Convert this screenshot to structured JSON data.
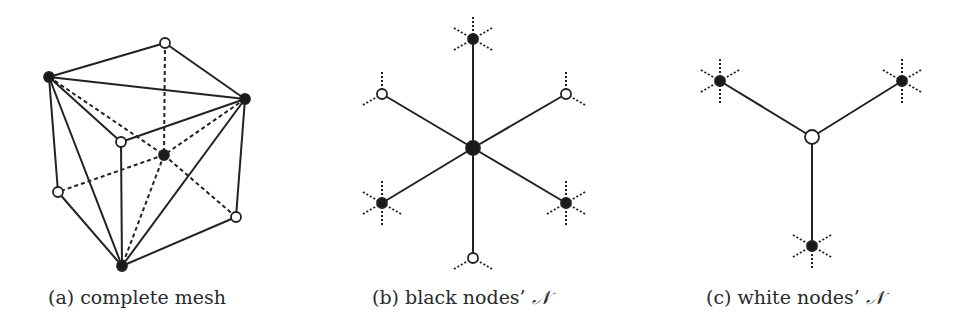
{
  "colors": {
    "ink": "#222222",
    "node_fill_black": "#1a1a1a",
    "node_fill_white": "#ffffff",
    "background": "#ffffff"
  },
  "panels": [
    {
      "id": "a",
      "caption_prefix": "(a) complete mesh",
      "caption_symbol": "",
      "caption_x": 48,
      "nodes": [
        {
          "id": "top_white",
          "x": 165,
          "y": 43,
          "color": "white",
          "r": 5
        },
        {
          "id": "left_black",
          "x": 49,
          "y": 77,
          "color": "black",
          "r": 5
        },
        {
          "id": "right_black",
          "x": 245,
          "y": 99,
          "color": "black",
          "r": 5
        },
        {
          "id": "front_white",
          "x": 121,
          "y": 142,
          "color": "white",
          "r": 5
        },
        {
          "id": "center_black",
          "x": 164,
          "y": 155,
          "color": "black",
          "r": 5
        },
        {
          "id": "left_white",
          "x": 58,
          "y": 192,
          "color": "white",
          "r": 5
        },
        {
          "id": "right_white",
          "x": 236,
          "y": 217,
          "color": "white",
          "r": 5
        },
        {
          "id": "bottom_black",
          "x": 122,
          "y": 266,
          "color": "black",
          "r": 5
        }
      ],
      "edges": [
        {
          "from": "left_black",
          "to": "top_white",
          "style": "solid"
        },
        {
          "from": "top_white",
          "to": "right_black",
          "style": "solid"
        },
        {
          "from": "left_black",
          "to": "right_black",
          "style": "solid"
        },
        {
          "from": "left_black",
          "to": "front_white",
          "style": "solid"
        },
        {
          "from": "front_white",
          "to": "right_black",
          "style": "solid"
        },
        {
          "from": "left_black",
          "to": "left_white",
          "style": "solid"
        },
        {
          "from": "left_black",
          "to": "bottom_black",
          "style": "solid"
        },
        {
          "from": "front_white",
          "to": "bottom_black",
          "style": "solid"
        },
        {
          "from": "right_black",
          "to": "bottom_black",
          "style": "solid"
        },
        {
          "from": "right_black",
          "to": "right_white",
          "style": "solid"
        },
        {
          "from": "right_white",
          "to": "bottom_black",
          "style": "solid"
        },
        {
          "from": "left_white",
          "to": "bottom_black",
          "style": "solid"
        },
        {
          "from": "top_white",
          "to": "center_black",
          "style": "dashed"
        },
        {
          "from": "left_black",
          "to": "center_black",
          "style": "dashed"
        },
        {
          "from": "center_black",
          "to": "right_white",
          "style": "dashed"
        },
        {
          "from": "right_black",
          "to": "center_black",
          "style": "dashed"
        },
        {
          "from": "center_black",
          "to": "left_white",
          "style": "dashed"
        },
        {
          "from": "center_black",
          "to": "bottom_black",
          "style": "dashed"
        }
      ]
    },
    {
      "id": "b",
      "caption_prefix": "(b) black nodes’ ",
      "caption_symbol": "𝒩",
      "caption_x": 372,
      "nodes": [
        {
          "id": "center",
          "x": 473,
          "y": 148,
          "color": "black",
          "r": 7
        },
        {
          "id": "top",
          "x": 473,
          "y": 39,
          "color": "black",
          "r": 5,
          "stubs": [
            90,
            30,
            150,
            210,
            330
          ]
        },
        {
          "id": "upper_left",
          "x": 382,
          "y": 94,
          "color": "white",
          "r": 5,
          "stubs": [
            90,
            210
          ]
        },
        {
          "id": "upper_right",
          "x": 566,
          "y": 94,
          "color": "white",
          "r": 5,
          "stubs": [
            90,
            330
          ]
        },
        {
          "id": "lower_left",
          "x": 382,
          "y": 203,
          "color": "black",
          "r": 5,
          "stubs": [
            90,
            150,
            210,
            270,
            330
          ]
        },
        {
          "id": "lower_right",
          "x": 566,
          "y": 203,
          "color": "black",
          "r": 5,
          "stubs": [
            90,
            30,
            210,
            270,
            330
          ]
        },
        {
          "id": "bottom",
          "x": 473,
          "y": 258,
          "color": "white",
          "r": 5,
          "stubs": [
            210,
            330
          ]
        }
      ],
      "edges": [
        {
          "from": "center",
          "to": "top",
          "style": "solid"
        },
        {
          "from": "center",
          "to": "upper_left",
          "style": "solid"
        },
        {
          "from": "center",
          "to": "upper_right",
          "style": "solid"
        },
        {
          "from": "center",
          "to": "lower_left",
          "style": "solid"
        },
        {
          "from": "center",
          "to": "lower_right",
          "style": "solid"
        },
        {
          "from": "center",
          "to": "bottom",
          "style": "solid"
        }
      ]
    },
    {
      "id": "c",
      "caption_prefix": "(c) white nodes’ ",
      "caption_symbol": "𝒩",
      "caption_x": 706,
      "nodes": [
        {
          "id": "center",
          "x": 812,
          "y": 137,
          "color": "white",
          "r": 7
        },
        {
          "id": "upper_left",
          "x": 720,
          "y": 81,
          "color": "black",
          "r": 5,
          "stubs": [
            90,
            30,
            150,
            210,
            270
          ]
        },
        {
          "id": "upper_right",
          "x": 902,
          "y": 81,
          "color": "black",
          "r": 5,
          "stubs": [
            90,
            30,
            150,
            270,
            330
          ]
        },
        {
          "id": "bottom",
          "x": 812,
          "y": 246,
          "color": "black",
          "r": 5,
          "stubs": [
            30,
            150,
            210,
            270,
            330
          ]
        }
      ],
      "edges": [
        {
          "from": "center",
          "to": "upper_left",
          "style": "solid"
        },
        {
          "from": "center",
          "to": "upper_right",
          "style": "solid"
        },
        {
          "from": "center",
          "to": "bottom",
          "style": "solid"
        }
      ]
    }
  ],
  "stub_length": 22
}
